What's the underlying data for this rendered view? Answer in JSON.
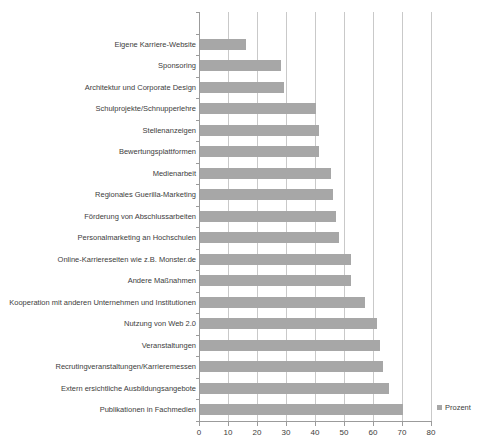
{
  "chart_data": {
    "type": "bar",
    "orientation": "horizontal",
    "title": "",
    "xlabel": "",
    "ylabel": "",
    "categories": [
      "Eigene Karriere-Website",
      "Sponsoring",
      "Architektur und Corporate Design",
      "Schulprojekte/Schnupperlehre",
      "Stellenanzeigen",
      "Bewertungsplattformen",
      "Medienarbeit",
      "Regionales Guerilla-Marketing",
      "Förderung von Abschlussarbeiten",
      "Personalmarketing an Hochschulen",
      "Online-Karriereseiten wie z.B. Monster.de",
      "Andere Maßnahmen",
      "Kooperation mit anderen Unternehmen und Institutionen",
      "Nutzung von Web 2.0",
      "Veranstaltungen",
      "Recrutingveranstaltungen/Karrieremessen",
      "Extern ersichtliche Ausbildungsangebote",
      "Publikationen in Fachmedien"
    ],
    "series": [
      {
        "name": "Prozent",
        "values": [
          16,
          28,
          29,
          40,
          41,
          41,
          45,
          46,
          47,
          48,
          52,
          52,
          57,
          61,
          62,
          63,
          65,
          70
        ]
      }
    ],
    "xlim": [
      0,
      80
    ],
    "x_ticks": [
      0,
      10,
      20,
      30,
      40,
      50,
      60,
      70,
      80
    ],
    "grid": true,
    "legend": {
      "label": "Prozent",
      "position": "bottom-right"
    },
    "bar_color": "#a7a7a7"
  }
}
